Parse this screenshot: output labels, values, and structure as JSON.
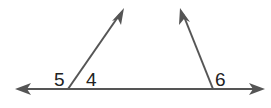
{
  "diagram": {
    "colors": {
      "line": "#555555",
      "text": "#222222"
    },
    "labels": [
      {
        "id": "angle-5",
        "text": "5",
        "x": 54,
        "y": 85
      },
      {
        "id": "angle-4",
        "text": "4",
        "x": 86,
        "y": 85
      },
      {
        "id": "angle-6",
        "text": "6",
        "x": 215,
        "y": 85
      }
    ],
    "lines": {
      "baseline": {
        "x1": 20,
        "y1": 89,
        "x2": 260,
        "y2": 89
      },
      "left_ray": {
        "x1": 68,
        "y1": 89,
        "x2": 120,
        "y2": 14
      },
      "right_ray": {
        "x1": 213,
        "y1": 89,
        "x2": 183,
        "y2": 14
      }
    }
  }
}
